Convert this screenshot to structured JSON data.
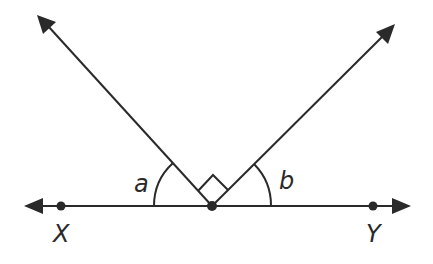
{
  "diagram": {
    "type": "geometry-angles",
    "line_color": "#2a2a2a",
    "background": "#ffffff",
    "labels": {
      "angle_a": "a",
      "angle_b": "b",
      "point_x": "X",
      "point_y": "Y"
    },
    "vertex": {
      "x": 212,
      "y": 206
    },
    "baseline": {
      "x1": 25,
      "x2": 410,
      "y": 206
    },
    "ray_left_tip": {
      "x": 37,
      "y": 15
    },
    "ray_right_tip": {
      "x": 395,
      "y": 24
    },
    "right_angle_marker": true
  }
}
